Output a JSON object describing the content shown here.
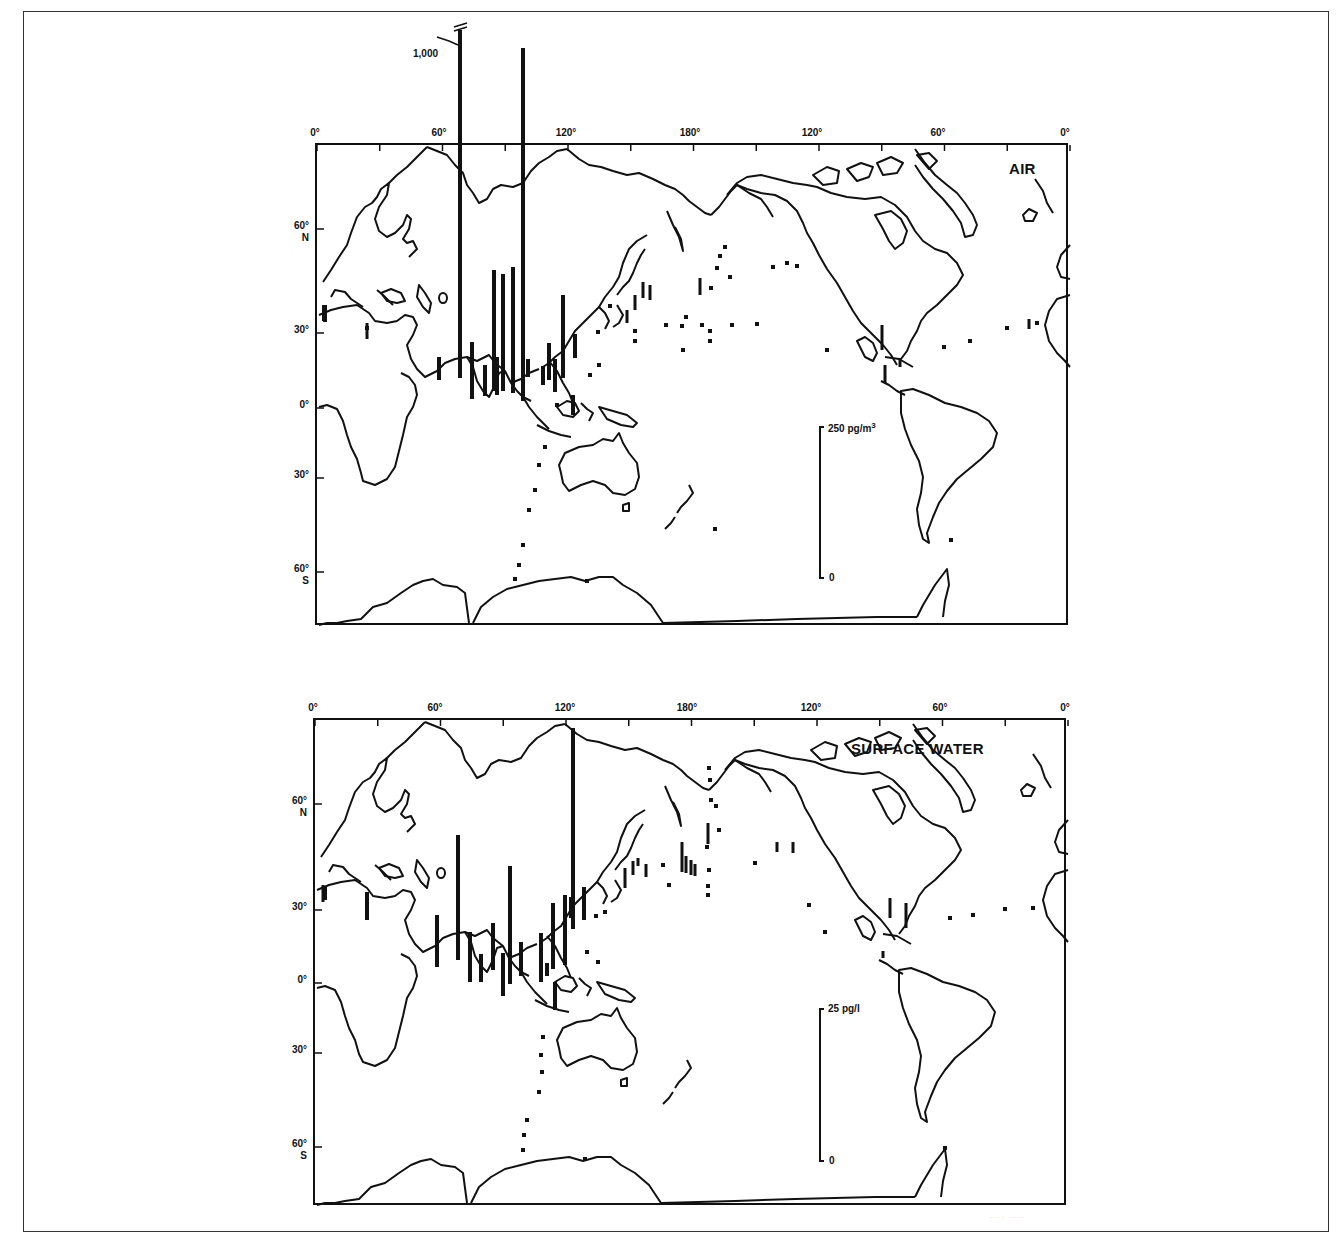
{
  "figure": {
    "panels": [
      {
        "id": "air",
        "title": "AIR",
        "frame": {
          "left": 315,
          "top": 143,
          "width": 753,
          "height": 482
        },
        "lon_labels": [
          {
            "text": "0°",
            "x": 0
          },
          {
            "text": "60°",
            "x": 124
          },
          {
            "text": "120°",
            "x": 251
          },
          {
            "text": "180°",
            "x": 375
          },
          {
            "text": "120°",
            "x": 497
          },
          {
            "text": "60°",
            "x": 623
          },
          {
            "text": "0°",
            "x": 750
          }
        ],
        "lat_labels": [
          {
            "text": "60°",
            "sub": "N",
            "y": 84
          },
          {
            "text": "30°",
            "sub": "",
            "y": 188
          },
          {
            "text": "0°",
            "sub": "",
            "y": 263
          },
          {
            "text": "30°",
            "sub": "",
            "y": 333
          },
          {
            "text": "60°",
            "sub": "S",
            "y": 427
          }
        ],
        "scale_bar": {
          "label": "250 pg/m",
          "label_sup": "3",
          "zero_label": "0",
          "x": 503,
          "top": 282,
          "bottom": 433
        },
        "break_label": "1,000",
        "bars": [
          {
            "x": 7,
            "y1": 160,
            "y2": 176,
            "w": 4
          },
          {
            "x": 50,
            "y1": 178,
            "y2": 194,
            "w": 3
          },
          {
            "x": 122,
            "y1": 212,
            "y2": 235,
            "w": 4
          },
          {
            "x": 143,
            "y1": -115,
            "y2": 233,
            "w": 4
          },
          {
            "x": 155,
            "y1": 197,
            "y2": 254,
            "w": 4
          },
          {
            "x": 168,
            "y1": 220,
            "y2": 251,
            "w": 4
          },
          {
            "x": 180,
            "y1": 212,
            "y2": 250,
            "w": 4
          },
          {
            "x": 177,
            "y1": 125,
            "y2": 246,
            "w": 4
          },
          {
            "x": 186,
            "y1": 129,
            "y2": 246,
            "w": 4
          },
          {
            "x": 196,
            "y1": 122,
            "y2": 248,
            "w": 4
          },
          {
            "x": 206,
            "y1": -97,
            "y2": 256,
            "w": 4
          },
          {
            "x": 211,
            "y1": 214,
            "y2": 232,
            "w": 4
          },
          {
            "x": 226,
            "y1": 221,
            "y2": 240,
            "w": 4
          },
          {
            "x": 232,
            "y1": 198,
            "y2": 235,
            "w": 4
          },
          {
            "x": 238,
            "y1": 214,
            "y2": 247,
            "w": 4
          },
          {
            "x": 246,
            "y1": 150,
            "y2": 233,
            "w": 4
          },
          {
            "x": 258,
            "y1": 189,
            "y2": 213,
            "w": 4
          },
          {
            "x": 256,
            "y1": 250,
            "y2": 270,
            "w": 4
          },
          {
            "x": 8,
            "y1": 160,
            "y2": 177,
            "w": 4
          },
          {
            "x": 310,
            "y1": 165,
            "y2": 178,
            "w": 3
          },
          {
            "x": 318,
            "y1": 150,
            "y2": 165,
            "w": 3
          },
          {
            "x": 326,
            "y1": 137,
            "y2": 153,
            "w": 3
          },
          {
            "x": 333,
            "y1": 140,
            "y2": 155,
            "w": 3
          },
          {
            "x": 383,
            "y1": 133,
            "y2": 150,
            "w": 3
          },
          {
            "x": 565,
            "y1": 180,
            "y2": 205,
            "w": 3
          },
          {
            "x": 568,
            "y1": 220,
            "y2": 238,
            "w": 3
          },
          {
            "x": 583,
            "y1": 213,
            "y2": 222,
            "w": 3
          },
          {
            "x": 712,
            "y1": 174,
            "y2": 184,
            "w": 3
          }
        ],
        "dots": [
          [
            8,
            167
          ],
          [
            50,
            183
          ],
          [
            318,
            186
          ],
          [
            293,
            161
          ],
          [
            281,
            187
          ],
          [
            282,
            220
          ],
          [
            273,
            230
          ],
          [
            240,
            260
          ],
          [
            228,
            302
          ],
          [
            222,
            320
          ],
          [
            218,
            345
          ],
          [
            212,
            365
          ],
          [
            206,
            400
          ],
          [
            202,
            420
          ],
          [
            198,
            434
          ],
          [
            270,
            436
          ],
          [
            318,
            196
          ],
          [
            349,
            180
          ],
          [
            365,
            181
          ],
          [
            369,
            172
          ],
          [
            385,
            180
          ],
          [
            393,
            186
          ],
          [
            393,
            196
          ],
          [
            415,
            180
          ],
          [
            394,
            143
          ],
          [
            400,
            123
          ],
          [
            403,
            111
          ],
          [
            408,
            102
          ],
          [
            413,
            132
          ],
          [
            440,
            179
          ],
          [
            456,
            122
          ],
          [
            470,
            118
          ],
          [
            480,
            121
          ],
          [
            366,
            205
          ],
          [
            510,
            205
          ],
          [
            627,
            202
          ],
          [
            653,
            196
          ],
          [
            690,
            183
          ],
          [
            720,
            178
          ],
          [
            634,
            395
          ],
          [
            398,
            384
          ]
        ]
      },
      {
        "id": "surface_water",
        "title": "SURFACE WATER",
        "frame": {
          "left": 313,
          "top": 718,
          "width": 753,
          "height": 487
        },
        "lon_labels": [
          {
            "text": "0°",
            "x": 0
          },
          {
            "text": "60°",
            "x": 122
          },
          {
            "text": "120°",
            "x": 252
          },
          {
            "text": "180°",
            "x": 374
          },
          {
            "text": "120°",
            "x": 498
          },
          {
            "text": "60°",
            "x": 627
          },
          {
            "text": "0°",
            "x": 752
          }
        ],
        "lat_labels": [
          {
            "text": "60°",
            "sub": "N",
            "y": 84
          },
          {
            "text": "30°",
            "sub": "",
            "y": 190
          },
          {
            "text": "0°",
            "sub": "",
            "y": 263
          },
          {
            "text": "30°",
            "sub": "",
            "y": 333
          },
          {
            "text": "60°",
            "sub": "S",
            "y": 427
          }
        ],
        "scale_bar": {
          "label": "25 pg/l",
          "label_sup": "",
          "zero_label": "0",
          "x": 505,
          "top": 289,
          "bottom": 441
        },
        "break_label": "",
        "bars": [
          {
            "x": 10,
            "y1": 166,
            "y2": 180,
            "w": 4
          },
          {
            "x": 52,
            "y1": 172,
            "y2": 200,
            "w": 4
          },
          {
            "x": 122,
            "y1": 195,
            "y2": 247,
            "w": 4
          },
          {
            "x": 143,
            "y1": 115,
            "y2": 240,
            "w": 4
          },
          {
            "x": 155,
            "y1": 212,
            "y2": 262,
            "w": 4
          },
          {
            "x": 166,
            "y1": 234,
            "y2": 262,
            "w": 4
          },
          {
            "x": 178,
            "y1": 203,
            "y2": 250,
            "w": 4
          },
          {
            "x": 188,
            "y1": 233,
            "y2": 276,
            "w": 4
          },
          {
            "x": 195,
            "y1": 146,
            "y2": 264,
            "w": 4
          },
          {
            "x": 206,
            "y1": 222,
            "y2": 256,
            "w": 4
          },
          {
            "x": 226,
            "y1": 213,
            "y2": 262,
            "w": 4
          },
          {
            "x": 232,
            "y1": 243,
            "y2": 256,
            "w": 4
          },
          {
            "x": 238,
            "y1": 183,
            "y2": 249,
            "w": 4
          },
          {
            "x": 250,
            "y1": 175,
            "y2": 245,
            "w": 4
          },
          {
            "x": 258,
            "y1": 8,
            "y2": 209,
            "w": 4
          },
          {
            "x": 256,
            "y1": 177,
            "y2": 198,
            "w": 4
          },
          {
            "x": 269,
            "y1": 167,
            "y2": 200,
            "w": 4
          },
          {
            "x": 240,
            "y1": 262,
            "y2": 290,
            "w": 4
          },
          {
            "x": 8,
            "y1": 165,
            "y2": 182,
            "w": 3
          },
          {
            "x": 310,
            "y1": 148,
            "y2": 168,
            "w": 3
          },
          {
            "x": 318,
            "y1": 141,
            "y2": 155,
            "w": 3
          },
          {
            "x": 323,
            "y1": 138,
            "y2": 146,
            "w": 3
          },
          {
            "x": 331,
            "y1": 144,
            "y2": 157,
            "w": 3
          },
          {
            "x": 367,
            "y1": 122,
            "y2": 152,
            "w": 3
          },
          {
            "x": 371,
            "y1": 136,
            "y2": 153,
            "w": 3
          },
          {
            "x": 376,
            "y1": 140,
            "y2": 155,
            "w": 3
          },
          {
            "x": 380,
            "y1": 144,
            "y2": 156,
            "w": 3
          },
          {
            "x": 393,
            "y1": 103,
            "y2": 124,
            "w": 3
          },
          {
            "x": 462,
            "y1": 122,
            "y2": 132,
            "w": 3
          },
          {
            "x": 478,
            "y1": 122,
            "y2": 133,
            "w": 3
          },
          {
            "x": 575,
            "y1": 178,
            "y2": 198,
            "w": 3
          },
          {
            "x": 591,
            "y1": 183,
            "y2": 208,
            "w": 3
          },
          {
            "x": 568,
            "y1": 231,
            "y2": 238,
            "w": 3
          }
        ],
        "dots": [
          [
            281,
            196
          ],
          [
            290,
            192
          ],
          [
            283,
            242
          ],
          [
            272,
            232
          ],
          [
            240,
            274
          ],
          [
            228,
            317
          ],
          [
            226,
            335
          ],
          [
            227,
            352
          ],
          [
            224,
            372
          ],
          [
            212,
            400
          ],
          [
            209,
            415
          ],
          [
            208,
            430
          ],
          [
            270,
            439
          ],
          [
            348,
            145
          ],
          [
            354,
            165
          ],
          [
            392,
            127
          ],
          [
            394,
            150
          ],
          [
            393,
            166
          ],
          [
            393,
            175
          ],
          [
            440,
            143
          ],
          [
            494,
            185
          ],
          [
            394,
            48
          ],
          [
            395,
            60
          ],
          [
            396,
            80
          ],
          [
            401,
            86
          ],
          [
            404,
            110
          ],
          [
            510,
            212
          ],
          [
            635,
            198
          ],
          [
            658,
            195
          ],
          [
            690,
            189
          ],
          [
            718,
            188
          ],
          [
            630,
            428
          ]
        ]
      }
    ]
  }
}
